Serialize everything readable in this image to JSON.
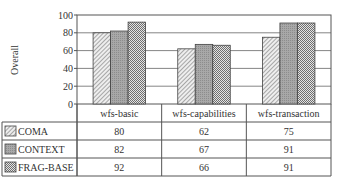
{
  "chart_data": {
    "type": "bar",
    "title": "",
    "xlabel": "",
    "ylabel": "Overall",
    "ylim": [
      0,
      100
    ],
    "yticks": [
      0,
      20,
      40,
      60,
      80,
      100
    ],
    "grid": true,
    "legend_position": "data-table-left",
    "categories": [
      "wfs-basic",
      "wfs-capabilities",
      "wfs-transaction"
    ],
    "series": [
      {
        "name": "COMA",
        "values": [
          80,
          62,
          75
        ],
        "pattern": "diagonal-hatch",
        "color": "#d9d9d9"
      },
      {
        "name": "CONTEXT",
        "values": [
          82,
          67,
          91
        ],
        "pattern": "dense-gray",
        "color": "#a6a6a6"
      },
      {
        "name": "FRAG-BASE",
        "values": [
          92,
          66,
          91
        ],
        "pattern": "checker",
        "color": "#c8c8c8"
      }
    ]
  }
}
